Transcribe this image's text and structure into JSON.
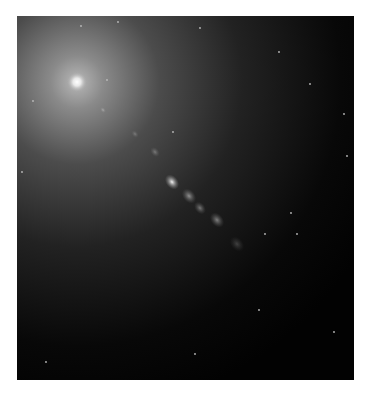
{
  "image": {
    "subject": "galaxy core with relativistic jet",
    "colors": {
      "background": "#ffffff",
      "sky": "#020202",
      "halo": "#9a9a9a",
      "core": "#ffffff"
    },
    "core": {
      "x": 60,
      "y": 66
    },
    "knots": [
      {
        "x": 86,
        "y": 94,
        "r": 2.5,
        "o": 0.35
      },
      {
        "x": 118,
        "y": 118,
        "r": 3,
        "o": 0.25
      },
      {
        "x": 138,
        "y": 136,
        "r": 4,
        "o": 0.3
      },
      {
        "x": 155,
        "y": 166,
        "r": 6,
        "o": 0.95
      },
      {
        "x": 172,
        "y": 180,
        "r": 6,
        "o": 0.5
      },
      {
        "x": 183,
        "y": 192,
        "r": 5,
        "o": 0.4
      },
      {
        "x": 200,
        "y": 204,
        "r": 6,
        "o": 0.45
      },
      {
        "x": 220,
        "y": 228,
        "r": 6,
        "o": 0.2
      }
    ],
    "stars": [
      {
        "x": 64,
        "y": 10
      },
      {
        "x": 101,
        "y": 6
      },
      {
        "x": 183,
        "y": 12
      },
      {
        "x": 262,
        "y": 36
      },
      {
        "x": 293,
        "y": 68
      },
      {
        "x": 327,
        "y": 98
      },
      {
        "x": 16,
        "y": 85
      },
      {
        "x": 156,
        "y": 116
      },
      {
        "x": 5,
        "y": 156
      },
      {
        "x": 274,
        "y": 197
      },
      {
        "x": 280,
        "y": 218
      },
      {
        "x": 330,
        "y": 140
      },
      {
        "x": 242,
        "y": 294
      },
      {
        "x": 317,
        "y": 316
      },
      {
        "x": 29,
        "y": 346
      },
      {
        "x": 178,
        "y": 338
      },
      {
        "x": 90,
        "y": 64
      },
      {
        "x": 248,
        "y": 218
      }
    ]
  }
}
